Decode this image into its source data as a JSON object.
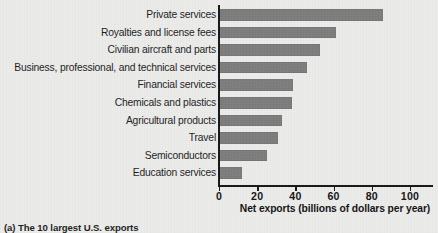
{
  "figure": {
    "caption": "(a) The 10 largest U.S. exports"
  },
  "chart_data": {
    "type": "bar",
    "orientation": "horizontal",
    "title": "",
    "subtitle": "",
    "xlabel": "Net exports (billions of dollars per year)",
    "ylabel": "",
    "xlim": [
      0,
      112
    ],
    "ylim": null,
    "grid": false,
    "legend": null,
    "legend_position": "none",
    "bar_color": "#7c7c7c",
    "axis_color": "#151515",
    "background_color": "#ececeb",
    "xticks": [
      0,
      20,
      40,
      60,
      80,
      100
    ],
    "xtick_labels": [
      "0",
      "20",
      "40",
      "60",
      "80",
      "100"
    ],
    "categories": [
      "Private services",
      "Royalties and license fees",
      "Civilian aircraft and parts",
      "Business, professional, and technical services",
      "Financial services",
      "Chemicals and plastics",
      "Agricultural products",
      "Travel",
      "Semiconductors",
      "Education services"
    ],
    "values": [
      86,
      61,
      53,
      46,
      39,
      38,
      33,
      31,
      25,
      12
    ],
    "annotations": []
  }
}
